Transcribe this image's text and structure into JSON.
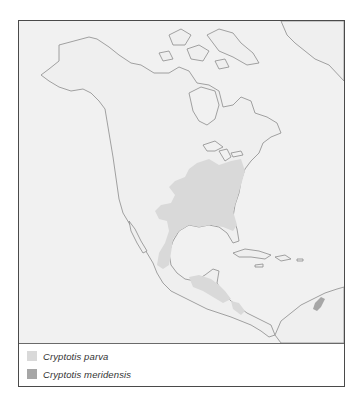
{
  "map": {
    "title": "Range map of Cryptotis parva and Cryptotis meridensis",
    "region": "North and Central America",
    "colors": {
      "ocean": "#f1f1f1",
      "land": "#eeeeee",
      "coastline": "#8a8a8a",
      "frame": "#4a4a4a"
    }
  },
  "legend": {
    "items": [
      {
        "label": "Cryptotis parva",
        "color": "#d9d9d9"
      },
      {
        "label": "Cryptotis meridensis",
        "color": "#a6a6a6"
      }
    ]
  }
}
